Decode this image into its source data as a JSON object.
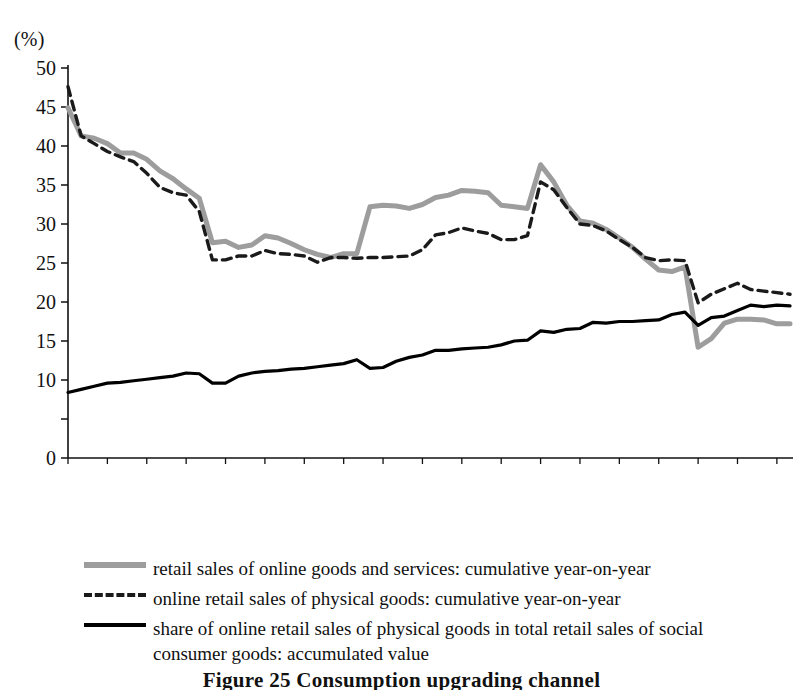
{
  "axis": {
    "unit_label": "(%)",
    "y_tick_labels": [
      "50",
      "45",
      "40",
      "35",
      "30",
      "25",
      "20",
      "15",
      "10",
      "0"
    ],
    "y_tick_values": [
      50,
      45,
      40,
      35,
      30,
      25,
      20,
      15,
      10,
      0
    ],
    "x_tick_labels": [
      "2015-2",
      "2015-5",
      "2015-8",
      "2015-11",
      "2016-2",
      "2016-5",
      "2016-8",
      "2016-11",
      "2017-2",
      "2017-5",
      "2017-8",
      "2017-11",
      "2018-2",
      "2018-5",
      "2018-8",
      "2018-11",
      "2019-2",
      "2019-5",
      "2019-8"
    ]
  },
  "legend": {
    "items": [
      {
        "marker": "solid-gray-line",
        "label": "retail sales of online goods and services: cumulative year-on-year",
        "color": "#9d9d9d"
      },
      {
        "marker": "dashed-black-line",
        "label": "online retail sales of physical goods: cumulative year-on-year",
        "color": "#1a1a1a"
      },
      {
        "marker": "solid-black-line",
        "label": "share of online retail sales of physical goods in total retail sales of social",
        "label_cont": "consumer goods: accumulated value",
        "color": "#000000"
      }
    ]
  },
  "caption": {
    "text": "Figure 25   Consumption upgrading channel"
  },
  "chart_data": {
    "type": "line",
    "title": "",
    "xlabel": "",
    "ylabel": "(%)",
    "ylim": [
      0,
      50
    ],
    "y_ticks": [
      0,
      10,
      15,
      20,
      25,
      30,
      35,
      40,
      45,
      50
    ],
    "grid": false,
    "legend_position": "below",
    "x": [
      "2015-2",
      "2015-3",
      "2015-4",
      "2015-5",
      "2015-6",
      "2015-7",
      "2015-8",
      "2015-9",
      "2015-10",
      "2015-11",
      "2015-12",
      "2016-1",
      "2016-2",
      "2016-3",
      "2016-4",
      "2016-5",
      "2016-6",
      "2016-7",
      "2016-8",
      "2016-9",
      "2016-10",
      "2016-11",
      "2016-12",
      "2017-1",
      "2017-2",
      "2017-3",
      "2017-4",
      "2017-5",
      "2017-6",
      "2017-7",
      "2017-8",
      "2017-9",
      "2017-10",
      "2017-11",
      "2017-12",
      "2018-1",
      "2018-2",
      "2018-3",
      "2018-4",
      "2018-5",
      "2018-6",
      "2018-7",
      "2018-8",
      "2018-9",
      "2018-10",
      "2018-11",
      "2018-12",
      "2019-1",
      "2019-2",
      "2019-3",
      "2019-4",
      "2019-5",
      "2019-6",
      "2019-7",
      "2019-8",
      "2019-9"
    ],
    "series": [
      {
        "name": "retail sales of online goods and services: cumulative year-on-year",
        "color": "#9d9d9d",
        "style": "solid",
        "width": 5,
        "values": [
          44.9,
          41.3,
          41.0,
          40.3,
          39.1,
          39.1,
          38.3,
          36.8,
          35.8,
          34.5,
          33.3,
          27.6,
          27.8,
          27.0,
          27.3,
          28.5,
          28.2,
          27.5,
          26.7,
          26.1,
          25.7,
          26.2,
          26.2,
          32.2,
          32.4,
          32.3,
          32.0,
          32.5,
          33.4,
          33.7,
          34.3,
          34.2,
          34.0,
          32.4,
          32.2,
          32.0,
          37.6,
          35.4,
          32.4,
          30.4,
          30.1,
          29.3,
          28.2,
          27.0,
          25.5,
          24.1,
          23.9,
          24.5,
          14.2,
          15.3,
          17.3,
          17.8,
          17.8,
          17.7,
          17.2,
          17.2
        ]
      },
      {
        "name": "online retail sales of physical goods: cumulative year-on-year",
        "color": "#1a1a1a",
        "style": "dashed",
        "width": 3.4,
        "values": [
          47.6,
          41.3,
          40.3,
          39.3,
          38.6,
          38.0,
          36.5,
          34.7,
          34.0,
          33.7,
          31.6,
          25.4,
          25.4,
          25.9,
          25.9,
          26.6,
          26.2,
          26.1,
          25.9,
          25.1,
          25.7,
          25.7,
          25.6,
          25.7,
          25.7,
          25.8,
          25.9,
          26.7,
          28.6,
          28.9,
          29.5,
          29.1,
          28.8,
          28.0,
          28.0,
          28.5,
          35.4,
          34.4,
          32.1,
          30.0,
          29.8,
          29.1,
          28.0,
          27.0,
          25.7,
          25.3,
          25.4,
          25.3,
          19.9,
          21.0,
          21.7,
          22.4,
          21.6,
          21.4,
          21.2,
          21.0
        ]
      },
      {
        "name": "share of online retail sales of physical goods in total retail sales of social consumer goods: accumulated value",
        "color": "#000000",
        "style": "solid",
        "width": 3.2,
        "values": [
          8.4,
          8.8,
          9.2,
          9.6,
          9.7,
          9.9,
          10.1,
          10.3,
          10.5,
          10.9,
          10.8,
          9.6,
          9.6,
          10.5,
          10.9,
          11.1,
          11.2,
          11.4,
          11.5,
          11.7,
          11.9,
          12.1,
          12.6,
          11.5,
          11.6,
          12.4,
          12.9,
          13.2,
          13.8,
          13.8,
          14.0,
          14.1,
          14.2,
          14.5,
          15.0,
          15.1,
          16.3,
          16.1,
          16.5,
          16.6,
          17.4,
          17.3,
          17.5,
          17.5,
          17.6,
          17.7,
          18.4,
          18.7,
          17.0,
          18.0,
          18.2,
          18.9,
          19.6,
          19.4,
          19.6,
          19.5
        ]
      }
    ]
  }
}
